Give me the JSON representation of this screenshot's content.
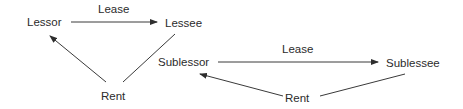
{
  "diagram": {
    "line_color": "#3a3a3a",
    "text_color": "#2b2b2b",
    "background": "#ffffff",
    "left_group": {
      "lessor": "Lessor",
      "lessee": "Lessee",
      "lease_label": "Lease",
      "rent_label": "Rent"
    },
    "right_group": {
      "sublessor": "Sublessor",
      "sublessee": "Sublessee",
      "lease_label": "Lease",
      "rent_label": "Rent"
    },
    "edges": [
      {
        "from": "Lessor",
        "to": "Lessee",
        "label": "Lease",
        "arrow_at": "Lessee"
      },
      {
        "from": "Lessee",
        "to": "Lessor",
        "via": "Rent",
        "arrow_at": "Lessor"
      },
      {
        "from": "Sublessor",
        "to": "Sublessee",
        "label": "Lease",
        "arrow_at": "Sublessee"
      },
      {
        "from": "Sublessee",
        "to": "Sublessor",
        "via": "Rent",
        "arrow_at": "Sublessor"
      }
    ]
  }
}
